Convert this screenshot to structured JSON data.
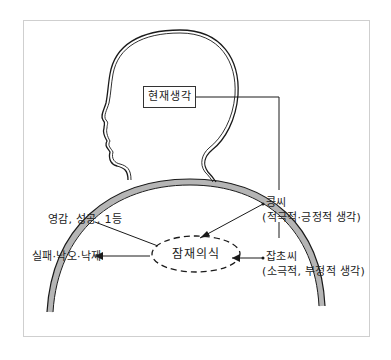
{
  "diagram": {
    "current_thought": "현재생각",
    "subconscious": "잠재의식",
    "bean_seed": {
      "title": "콩씨",
      "description": "(적극적·긍정적 생각)"
    },
    "weed_seed": {
      "title": "잡초씨",
      "description": "(소극적, 부정적 생각)"
    },
    "positive_outcome": "영감, 성공, 1등",
    "negative_outcome": "실패·낙오·낙제"
  },
  "colors": {
    "line": "#1a1a1a",
    "frame": "#cfcfcf",
    "shoulder_shade": "#b5b5b5",
    "background": "#ffffff"
  }
}
